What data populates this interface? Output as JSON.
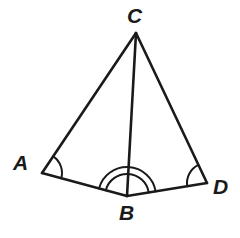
{
  "figure": {
    "kind": "geometry-diagram",
    "background_color": "#ffffff",
    "stroke_color": "#1a1a1a",
    "stroke_width": 2.6,
    "arc_stroke_width": 2.0
  },
  "labels": {
    "A": "A",
    "B": "B",
    "C": "C",
    "D": "D"
  },
  "points": {
    "A": {
      "x": 42,
      "y": 173
    },
    "B": {
      "x": 127,
      "y": 196
    },
    "C": {
      "x": 136,
      "y": 33
    },
    "D": {
      "x": 207,
      "y": 183
    }
  },
  "segments": [
    {
      "name": "segment-CA",
      "from": "C",
      "to": "A"
    },
    {
      "name": "segment-CB",
      "from": "C",
      "to": "B"
    },
    {
      "name": "segment-CD",
      "from": "C",
      "to": "D"
    },
    {
      "name": "segment-AB",
      "from": "A",
      "to": "B"
    },
    {
      "name": "segment-BD",
      "from": "B",
      "to": "D"
    }
  ],
  "angle_marks": [
    {
      "name": "angle-mark-A",
      "vertex": "A",
      "arcs": 1,
      "radii": [
        20
      ]
    },
    {
      "name": "angle-mark-D",
      "vertex": "D",
      "arcs": 1,
      "radii": [
        20
      ]
    },
    {
      "name": "angle-mark-B",
      "vertex": "B",
      "arcs": 2,
      "radii": [
        22,
        29
      ]
    }
  ]
}
